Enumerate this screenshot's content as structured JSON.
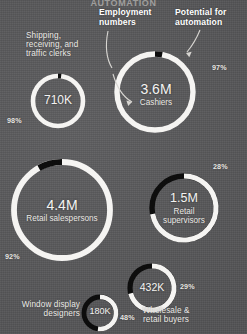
{
  "background_color": "#58585a",
  "arc_color_employment": "#f5f4f2",
  "arc_color_automation": "#0d0d0d",
  "title_partial": "AUTOMATION",
  "annotations": {
    "employment": "Employment\nnumbers",
    "employment_line1": "Employment",
    "employment_line2": "numbers",
    "automation": "Potential for\nautomation",
    "automation_line1": "Potential for",
    "automation_line2": "automation"
  },
  "chart_data": {
    "type": "pie",
    "title": "AUTOMATION",
    "legend": [
      "Employment numbers",
      "Potential for automation"
    ],
    "legend_position": "top",
    "unit": "percent of job automatable",
    "series": [
      {
        "name": "Shipping, receiving, and traffic clerks",
        "employment_label": "710K",
        "employment_value": 710000,
        "automation_pct": 98,
        "pct_label": "98%"
      },
      {
        "name": "Cashiers",
        "employment_label": "3.6M",
        "employment_value": 3600000,
        "automation_pct": 97,
        "pct_label": "97%"
      },
      {
        "name": "Retail salespersons",
        "employment_label": "4.4M",
        "employment_value": 4400000,
        "automation_pct": 92,
        "pct_label": "92%"
      },
      {
        "name": "Retail supervisors",
        "employment_label": "1.5M",
        "employment_value": 1500000,
        "automation_pct": 28,
        "pct_label": "28%"
      },
      {
        "name": "Wholesale & retail buyers",
        "employment_label": "432K",
        "employment_value": 432000,
        "automation_pct": 29,
        "pct_label": "29%"
      },
      {
        "name": "Window display designers",
        "employment_label": "180K",
        "employment_value": 180000,
        "automation_pct": 48,
        "pct_label": "48%"
      }
    ]
  },
  "donuts": {
    "clerks": {
      "number": "710K",
      "label_line1": "Shipping,",
      "label_line2": "receiving, and",
      "label_line3": "traffic clerks",
      "pct": "98%"
    },
    "cashiers": {
      "number": "3.6M",
      "label": "Cashiers",
      "pct": "97%"
    },
    "salespersons": {
      "number": "4.4M",
      "label": "Retail salespersons",
      "pct": "92%"
    },
    "supervisors": {
      "number": "1.5M",
      "label_line1": "Retail",
      "label_line2": "supervisors",
      "pct": "28%"
    },
    "buyers": {
      "number": "432K",
      "label_line1": "Wholesale &",
      "label_line2": "retail buyers",
      "pct": "29%"
    },
    "designers": {
      "number": "180K",
      "label_line1": "Window display",
      "label_line2": "designers",
      "pct": "48%"
    }
  }
}
